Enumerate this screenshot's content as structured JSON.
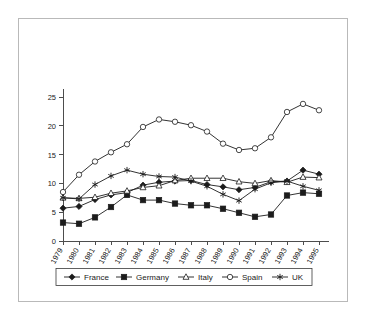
{
  "chart_data": {
    "type": "line",
    "title": "",
    "subtitle": "",
    "xlabel": "",
    "ylabel": "",
    "grid": false,
    "legend_position": "bottom",
    "ylim": [
      0,
      25
    ],
    "yticks": [
      0,
      5,
      10,
      15,
      20,
      25
    ],
    "ytick_labels": [
      "0",
      "5",
      "10",
      "15",
      "20",
      "25"
    ],
    "categories": [
      "1979",
      "1980",
      "1981",
      "1982",
      "1983",
      "1984",
      "1985",
      "1986",
      "1987",
      "1988",
      "1989",
      "1990",
      "1991",
      "1992",
      "1993",
      "1994",
      "1995"
    ],
    "series": [
      {
        "name": "France",
        "marker": "filled-diamond",
        "values": [
          5.7,
          6.0,
          7.2,
          8.0,
          8.4,
          9.7,
          10.2,
          10.4,
          10.5,
          9.8,
          9.4,
          8.9,
          9.3,
          10.3,
          10.4,
          12.3,
          11.6
        ]
      },
      {
        "name": "Germany",
        "marker": "filled-square",
        "values": [
          3.2,
          3.0,
          4.1,
          5.9,
          8.0,
          7.1,
          7.1,
          6.5,
          6.2,
          6.2,
          5.6,
          4.9,
          4.2,
          4.6,
          7.9,
          8.4,
          8.2
        ]
      },
      {
        "name": "Italy",
        "marker": "open-triangle",
        "values": [
          7.5,
          7.4,
          7.6,
          8.3,
          8.7,
          9.3,
          9.6,
          10.5,
          10.9,
          10.9,
          10.9,
          10.3,
          10.0,
          10.5,
          10.2,
          11.1,
          11.0
        ]
      },
      {
        "name": "Spain",
        "marker": "open-circle",
        "values": [
          8.5,
          11.5,
          13.8,
          15.4,
          16.8,
          19.8,
          21.1,
          20.7,
          20.1,
          19.0,
          16.9,
          15.8,
          16.1,
          18.0,
          22.4,
          23.8,
          22.7
        ]
      },
      {
        "name": "UK",
        "marker": "star",
        "values": [
          7.5,
          7.3,
          9.8,
          11.3,
          12.3,
          11.6,
          11.2,
          11.1,
          10.4,
          9.5,
          8.1,
          7.0,
          9.0,
          10.1,
          10.4,
          9.5,
          8.8
        ]
      }
    ],
    "legend_entries": [
      {
        "label": "France",
        "marker": "filled-diamond"
      },
      {
        "label": "Germany",
        "marker": "filled-square"
      },
      {
        "label": "Italy",
        "marker": "open-triangle"
      },
      {
        "label": "Spain",
        "marker": "open-circle"
      },
      {
        "label": "UK",
        "marker": "star"
      }
    ]
  },
  "colors": {
    "ink": "#1c1c1c",
    "axis": "#4d4d4d",
    "frame": "#b9b9b9",
    "background": "#ffffff"
  }
}
